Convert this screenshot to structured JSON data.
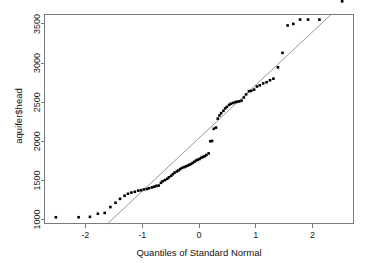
{
  "chart_data": {
    "type": "scatter",
    "title": "",
    "subtitle": "",
    "xlabel": "Quantiles of Standard Normal",
    "ylabel": "aquifer$head",
    "xlim": [
      -2.72,
      2.72
    ],
    "ylim": [
      950,
      3620
    ],
    "xticks": [
      -2,
      -1,
      0,
      1,
      2
    ],
    "xtick_labels": [
      "-2",
      "-1",
      "0",
      "1",
      "2"
    ],
    "yticks": [
      1000,
      1500,
      2000,
      2500,
      3000,
      3500
    ],
    "ytick_labels": [
      "1000",
      "1500",
      "2000",
      "2500",
      "3000",
      "3500"
    ],
    "grid": false,
    "legend": null,
    "point_marker": "filled-square",
    "point_size_px": 2.6,
    "point_color": "#000000",
    "reference_line": {
      "name": "qqline",
      "color": "#8c8c8c",
      "x1": -1.57,
      "y1": 975,
      "x2": 2.32,
      "y2": 3620,
      "slope": 679.0,
      "intercept": 2041.0
    },
    "x": [
      -2.52,
      -2.12,
      -1.92,
      -1.78,
      -1.66,
      -1.56,
      -1.47,
      -1.39,
      -1.31,
      -1.25,
      -1.19,
      -1.13,
      -1.07,
      -1.02,
      -0.97,
      -0.92,
      -0.88,
      -0.83,
      -0.79,
      -0.75,
      -0.71,
      -0.67,
      -0.64,
      -0.6,
      -0.56,
      -0.53,
      -0.49,
      -0.46,
      -0.43,
      -0.39,
      -0.36,
      -0.33,
      -0.3,
      -0.26,
      -0.23,
      -0.2,
      -0.17,
      -0.14,
      -0.11,
      -0.08,
      -0.05,
      -0.02,
      0.01,
      0.04,
      0.07,
      0.1,
      0.13,
      0.17,
      0.2,
      0.23,
      0.26,
      0.3,
      0.33,
      0.36,
      0.39,
      0.43,
      0.46,
      0.49,
      0.53,
      0.56,
      0.6,
      0.64,
      0.67,
      0.71,
      0.75,
      0.79,
      0.83,
      0.88,
      0.92,
      0.97,
      1.02,
      1.07,
      1.13,
      1.19,
      1.25,
      1.31,
      1.39,
      1.47,
      1.56,
      1.66,
      1.78,
      1.92,
      2.12,
      2.52
    ],
    "y": [
      1030,
      1030,
      1035,
      1075,
      1085,
      1160,
      1215,
      1265,
      1305,
      1330,
      1345,
      1355,
      1370,
      1375,
      1385,
      1390,
      1400,
      1410,
      1420,
      1430,
      1435,
      1470,
      1490,
      1505,
      1520,
      1540,
      1560,
      1580,
      1600,
      1615,
      1630,
      1645,
      1660,
      1670,
      1680,
      1690,
      1700,
      1710,
      1725,
      1740,
      1755,
      1765,
      1775,
      1790,
      1800,
      1810,
      1825,
      1845,
      2000,
      2005,
      2160,
      2175,
      2290,
      2330,
      2360,
      2390,
      2420,
      2440,
      2465,
      2480,
      2490,
      2500,
      2505,
      2510,
      2520,
      2560,
      2600,
      2640,
      2645,
      2660,
      2700,
      2715,
      2740,
      2755,
      2780,
      2800,
      2945,
      3130,
      3480,
      3500,
      3555,
      3555,
      3555
    ],
    "n_points": 83
  },
  "axes": {
    "x_title": "Quantiles of Standard Normal",
    "y_title": "aquifer$head"
  }
}
